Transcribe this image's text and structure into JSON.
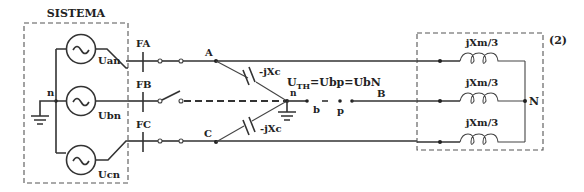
{
  "diagram": {
    "system_box": {
      "label": "SISTEMA"
    },
    "sources": [
      {
        "id": "a",
        "label": "Uan",
        "symbol": "~"
      },
      {
        "id": "b",
        "label": "Ubn",
        "symbol": "~"
      },
      {
        "id": "c",
        "label": "Ucn",
        "symbol": "~"
      }
    ],
    "neutral_label": "n",
    "breakers": [
      {
        "label": "FA"
      },
      {
        "label": "FB"
      },
      {
        "label": "FC"
      }
    ],
    "nodes": {
      "A": "A",
      "B": "B",
      "C": "C",
      "n": "n",
      "b": "b",
      "p": "p",
      "N": "N"
    },
    "capacitors": [
      {
        "label": "-jXc"
      },
      {
        "label": "-jXc"
      }
    ],
    "thevenin_label_main": "U",
    "thevenin_label_sub": "TH",
    "thevenin_label_rest": "=Ubp=UbN",
    "load_box": {
      "tag": "(2)",
      "inductors": [
        {
          "label": "jXm/3"
        },
        {
          "label": "jXm/3"
        },
        {
          "label": "jXm/3"
        }
      ]
    },
    "colors": {
      "line": "#333333",
      "background": "#ffffff"
    }
  }
}
